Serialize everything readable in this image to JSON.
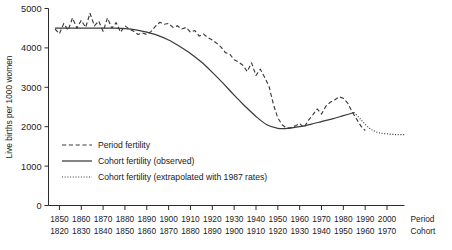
{
  "chart_data": {
    "type": "line",
    "title": "",
    "ylabel": "Live births per 1000 women",
    "xlabel": "",
    "ylim": [
      0,
      5000
    ],
    "y_ticks": [
      0,
      1000,
      2000,
      3000,
      4000,
      5000
    ],
    "y_tick_labels": [
      "0",
      "1000",
      "2000",
      "3000",
      "4000",
      "5000"
    ],
    "grid": false,
    "legend_position": "inside-lower-left",
    "x_axes": [
      {
        "name": "Period",
        "ticks": [
          1850,
          1860,
          1870,
          1880,
          1890,
          1900,
          1910,
          1920,
          1930,
          1940,
          1950,
          1960,
          1970,
          1980,
          1990,
          2000
        ],
        "tick_labels": [
          "1850",
          "1860",
          "1870",
          "1880",
          "1890",
          "1900",
          "1910",
          "1920",
          "1930",
          "1940",
          "1950",
          "1960",
          "1970",
          "1980",
          "1990",
          "2000"
        ]
      },
      {
        "name": "Cohort",
        "ticks": [
          1820,
          1830,
          1840,
          1850,
          1860,
          1870,
          1880,
          1890,
          1900,
          1910,
          1920,
          1930,
          1940,
          1950,
          1960,
          1970
        ],
        "tick_labels": [
          "1820",
          "1830",
          "1840",
          "1850",
          "1860",
          "1870",
          "1880",
          "1890",
          "1900",
          "1910",
          "1920",
          "1930",
          "1940",
          "1950",
          "1960",
          "1970"
        ]
      }
    ],
    "xlim": [
      1845,
      2008
    ],
    "series": [
      {
        "name": "Period fertility",
        "style": "dashed",
        "color": "#3a3a3a",
        "x": [
          1848,
          1850,
          1852,
          1854,
          1856,
          1858,
          1860,
          1862,
          1864,
          1866,
          1868,
          1870,
          1872,
          1874,
          1876,
          1878,
          1880,
          1882,
          1884,
          1886,
          1888,
          1890,
          1892,
          1894,
          1896,
          1898,
          1900,
          1902,
          1904,
          1906,
          1908,
          1910,
          1912,
          1914,
          1916,
          1918,
          1920,
          1922,
          1924,
          1926,
          1928,
          1930,
          1932,
          1934,
          1936,
          1938,
          1940,
          1942,
          1944,
          1946,
          1948,
          1950,
          1952,
          1954,
          1956,
          1958,
          1960,
          1962,
          1964,
          1966,
          1968,
          1970,
          1972,
          1974,
          1976,
          1978,
          1980,
          1982,
          1984,
          1986,
          1988,
          1990
        ],
        "values": [
          4480,
          4360,
          4620,
          4450,
          4760,
          4500,
          4700,
          4520,
          4880,
          4560,
          4680,
          4420,
          4760,
          4500,
          4640,
          4400,
          4560,
          4480,
          4420,
          4340,
          4380,
          4340,
          4420,
          4550,
          4650,
          4600,
          4620,
          4520,
          4560,
          4480,
          4520,
          4400,
          4440,
          4300,
          4350,
          4260,
          4200,
          4120,
          4020,
          3880,
          3840,
          3700,
          3640,
          3560,
          3400,
          3620,
          3300,
          3460,
          3250,
          3020,
          2560,
          2220,
          2050,
          1960,
          1980,
          2020,
          2080,
          1980,
          2160,
          2300,
          2450,
          2320,
          2520,
          2620,
          2680,
          2760,
          2720,
          2600,
          2380,
          2200,
          2020,
          1900
        ],
        "ylabel_units": "live births per 1000 women"
      },
      {
        "name": "Cohort fertility (observed)",
        "style": "solid",
        "color": "#3a3a3a",
        "x": [
          1848,
          1855,
          1862,
          1869,
          1875,
          1880,
          1885,
          1890,
          1895,
          1900,
          1905,
          1910,
          1915,
          1920,
          1925,
          1930,
          1935,
          1940,
          1945,
          1950,
          1955,
          1960,
          1965,
          1970,
          1975,
          1980,
          1985
        ],
        "values": [
          4500,
          4500,
          4500,
          4500,
          4500,
          4490,
          4460,
          4400,
          4320,
          4200,
          4040,
          3860,
          3640,
          3380,
          3100,
          2800,
          2520,
          2260,
          2050,
          1960,
          1960,
          2000,
          2060,
          2130,
          2200,
          2280,
          2360
        ]
      },
      {
        "name": "Cohort fertility (extrapolated with 1987 rates)",
        "style": "dotted",
        "color": "#3a3a3a",
        "x": [
          1985,
          1988,
          1992,
          1996,
          2000,
          2004,
          2008
        ],
        "values": [
          2360,
          2180,
          1960,
          1850,
          1820,
          1800,
          1800
        ]
      }
    ],
    "legend": [
      {
        "label": "Period fertility",
        "style": "dashed"
      },
      {
        "label": "Cohort fertility (observed)",
        "style": "solid"
      },
      {
        "label": "Cohort fertility (extrapolated with 1987 rates)",
        "style": "dotted"
      }
    ]
  }
}
